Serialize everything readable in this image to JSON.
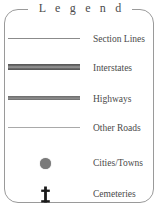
{
  "legend": {
    "title": "L e g e n d",
    "title_plain": "Legend",
    "colors": {
      "frame": "#9a9a9a",
      "text": "#4a4a4a",
      "title_text": "#4c4c4c",
      "section_line": "#8b8b8b",
      "interstate_line": "#6e6e6e",
      "highway_line": "#7d7d7d",
      "other_road_line": "#a9a9a9",
      "city_dot": "#7a7a7a",
      "cemetery_cross": "#1a1a1a",
      "background": "#ffffff"
    },
    "items": [
      {
        "label": "Section Lines",
        "symbol": "thin-line-swatch"
      },
      {
        "label": "Interstates",
        "symbol": "double-thick-line-swatch"
      },
      {
        "label": "Highways",
        "symbol": "thick-line-swatch"
      },
      {
        "label": "Other Roads",
        "symbol": "hairline-swatch"
      },
      {
        "label": "Cities/Towns",
        "symbol": "filled-circle-icon"
      },
      {
        "label": "Cemeteries",
        "symbol": "cross-icon"
      }
    ]
  }
}
